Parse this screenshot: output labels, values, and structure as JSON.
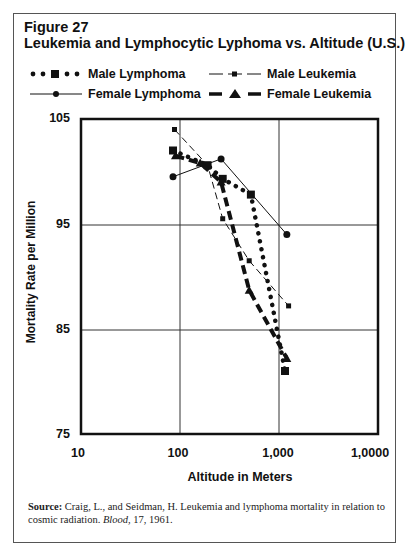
{
  "figure": {
    "number": "Figure 27",
    "title": "Leukemia and Lymphocytic Lyphoma vs. Altitude (U.S.)"
  },
  "legend": [
    {
      "label": "Male Lymphoma",
      "style": "dotted",
      "marker": "square"
    },
    {
      "label": "Male Leukemia",
      "style": "thin-dashed",
      "marker": "small-square"
    },
    {
      "label": "Female Lymphoma",
      "style": "solid",
      "marker": "circle"
    },
    {
      "label": "Female Leukemia",
      "style": "bold-dashed",
      "marker": "triangle"
    }
  ],
  "axes": {
    "ylabel": "Mortality Rate per Million",
    "xlabel": "Altitude in Meters",
    "y_ticks": [
      "105",
      "95",
      "85",
      "75"
    ],
    "x_ticks": [
      "10",
      "100",
      "1,000",
      "1,0000"
    ]
  },
  "source": {
    "label": "Source:",
    "text": " Craig, L., and Seidman, H. Leukemia and lymphoma mortality in relation to cosmic radiation. ",
    "journal": "Blood",
    "tail": ", 17, 1961."
  },
  "chart_data": {
    "type": "line",
    "title": "Leukemia and Lymphocytic Lyphoma vs. Altitude (U.S.)",
    "subtitle": "Figure 27",
    "xlabel": "Altitude in Meters",
    "ylabel": "Mortality Rate per Million",
    "xscale": "log",
    "xlim": [
      10,
      10000
    ],
    "ylim": [
      75,
      105
    ],
    "x_tick_labels": [
      "10",
      "100",
      "1,000",
      "1,0000"
    ],
    "y_tick_labels": [
      "75",
      "85",
      "95",
      "105"
    ],
    "grid": true,
    "legend_position": "top",
    "series": [
      {
        "name": "Male Lymphoma",
        "x": [
          85,
          190,
          270,
          520,
          1150
        ],
        "y": [
          102.0,
          100.6,
          99.3,
          97.8,
          81.0
        ]
      },
      {
        "name": "Male Leukemia",
        "x": [
          88,
          190,
          270,
          500,
          1250
        ],
        "y": [
          104.0,
          100.6,
          95.5,
          91.5,
          87.2
        ]
      },
      {
        "name": "Female Lymphoma",
        "x": [
          85,
          260,
          1200
        ],
        "y": [
          99.5,
          101.2,
          94.0
        ]
      },
      {
        "name": "Female Leukemia",
        "x": [
          90,
          160,
          260,
          500,
          1200
        ],
        "y": [
          101.5,
          100.8,
          99.0,
          88.7,
          82.2
        ]
      }
    ]
  }
}
